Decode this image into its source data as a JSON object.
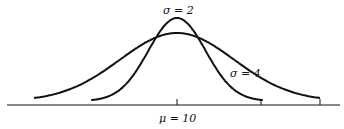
{
  "chart_data": {
    "type": "line",
    "title": "",
    "xlabel": "",
    "ylabel": "",
    "grid": false,
    "legend": "none",
    "mean": 10,
    "axis_label": "μ = 10",
    "series": [
      {
        "name": "σ = 2",
        "mu": 10,
        "sigma": 2,
        "x_range": [
          4,
          16
        ],
        "label_position": "above peak"
      },
      {
        "name": "σ = 4",
        "mu": 10,
        "sigma": 4,
        "x_range": [
          0,
          20
        ],
        "label_position": "right flank"
      }
    ],
    "annotations": [
      {
        "text": "σ = 2",
        "target": "narrow curve"
      },
      {
        "text": "σ = 4",
        "target": "wide curve"
      },
      {
        "text": "μ = 10",
        "target": "center tick on x-axis"
      }
    ]
  },
  "labels": {
    "sigma2": "σ = 2",
    "sigma4": "σ = 4",
    "mu": "μ = 10"
  },
  "style": {
    "stroke": "#111111",
    "background": "#ffffff"
  }
}
